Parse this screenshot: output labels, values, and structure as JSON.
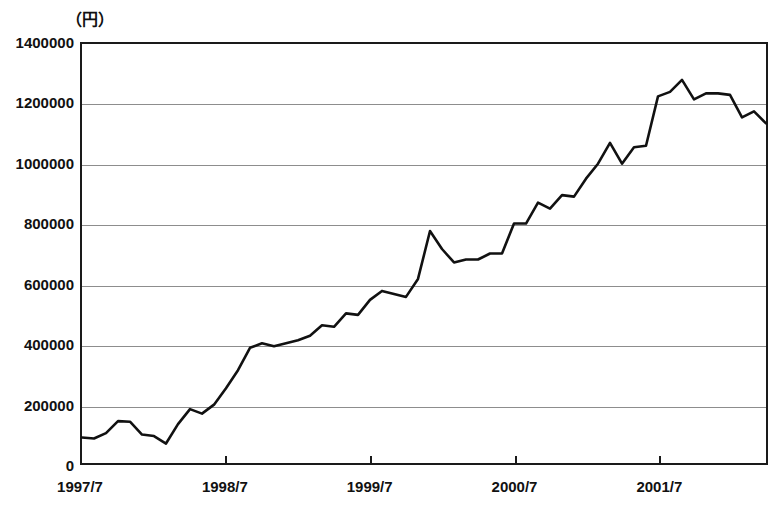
{
  "axes": {
    "unit_label": "（円）",
    "y_ticks": [
      0,
      200000,
      400000,
      600000,
      800000,
      1000000,
      1200000,
      1400000
    ],
    "y_tick_labels": [
      "0",
      "200000",
      "400000",
      "600000",
      "800000",
      "1000000",
      "1200000",
      "1400000"
    ],
    "x_tick_labels": [
      "1997/7",
      "1998/7",
      "1999/7",
      "2000/7",
      "2001/7"
    ],
    "x_tick_values": [
      "1997-07",
      "1998-07",
      "1999-07",
      "2000-07",
      "2001-07"
    ]
  },
  "style": {
    "line_color": "#111111",
    "grid_color": "#8d8d8d",
    "frame_color": "#1a1a1a",
    "background": "#ffffff"
  },
  "chart_data": {
    "type": "line",
    "title": "",
    "subtitle": "",
    "xlabel": "",
    "ylabel": "（円）",
    "ylim": [
      0,
      1400000
    ],
    "xlim": [
      "1997-07",
      "2002-04"
    ],
    "grid": true,
    "legend": "none",
    "y_tick_step": 200000,
    "x_tick_interval_months": 12,
    "x": [
      "1997-07",
      "1997-08",
      "1997-09",
      "1997-10",
      "1997-11",
      "1997-12",
      "1998-01",
      "1998-02",
      "1998-03",
      "1998-04",
      "1998-05",
      "1998-06",
      "1998-07",
      "1998-08",
      "1998-09",
      "1998-10",
      "1998-11",
      "1998-12",
      "1999-01",
      "1999-02",
      "1999-03",
      "1999-04",
      "1999-05",
      "1999-06",
      "1999-07",
      "1999-08",
      "1999-09",
      "1999-10",
      "1999-11",
      "1999-12",
      "2000-01",
      "2000-02",
      "2000-03",
      "2000-04",
      "2000-05",
      "2000-06",
      "2000-07",
      "2000-08",
      "2000-09",
      "2000-10",
      "2000-11",
      "2000-12",
      "2001-01",
      "2001-02",
      "2001-03",
      "2001-04",
      "2001-05",
      "2001-06",
      "2001-07",
      "2001-08",
      "2001-09",
      "2001-10",
      "2001-11",
      "2001-12",
      "2002-01",
      "2002-02",
      "2002-03",
      "2002-04"
    ],
    "series": [
      {
        "name": "金額",
        "values": [
          85000,
          82000,
          100000,
          140000,
          138000,
          95000,
          90000,
          65000,
          130000,
          180000,
          165000,
          195000,
          250000,
          310000,
          385000,
          400000,
          390000,
          400000,
          410000,
          425000,
          460000,
          455000,
          500000,
          495000,
          545000,
          575000,
          565000,
          555000,
          615000,
          775000,
          715000,
          670000,
          680000,
          680000,
          700000,
          700000,
          800000,
          800000,
          870000,
          850000,
          895000,
          890000,
          950000,
          1000000,
          1070000,
          1000000,
          1055000,
          1060000,
          1225000,
          1240000,
          1280000,
          1215000,
          1235000,
          1235000,
          1230000,
          1155000,
          1175000,
          1135000
        ]
      }
    ]
  }
}
